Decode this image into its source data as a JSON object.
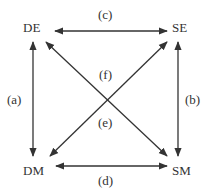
{
  "nodes": {
    "de": "DE",
    "se": "SE",
    "dm": "DM",
    "sm": "SM"
  },
  "edges": {
    "a": "(a)",
    "b": "(b)",
    "c": "(c)",
    "d": "(d)",
    "e": "(e)",
    "f": "(f)"
  },
  "colors": {
    "line": "#333333",
    "text": "#333333"
  }
}
